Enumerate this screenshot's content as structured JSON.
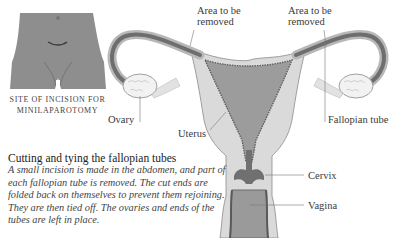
{
  "figure": {
    "inset": {
      "caption_line1": "Site of incision for",
      "caption_line2": "minilaparotomy"
    },
    "labels": {
      "area_left_line1": "Area to be",
      "area_left_line2": "removed",
      "area_right_line1": "Area to be",
      "area_right_line2": "removed",
      "ovary": "Ovary",
      "uterus": "Uterus",
      "fallopian_tube": "Fallopian tube",
      "cervix": "Cervix",
      "vagina": "Vagina"
    },
    "text_block": {
      "heading": "Cutting and tying the fallopian tubes",
      "body": "A small incision is made in the abdomen, and part of each fallopian tube is removed. The cut ends are folded back on themselves to prevent them rejoining. They are then tied off. The ovaries and ends of the tubes are left in place."
    },
    "colors": {
      "tissue_light": "#d6d6d6",
      "tissue_mid": "#9a9a9a",
      "tissue_dark": "#6e6e6e",
      "inset_body": "#8e8e8e",
      "ovary": "#f2f2f2"
    }
  }
}
